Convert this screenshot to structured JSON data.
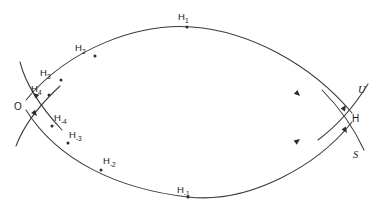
{
  "figure": {
    "name": "homoclinic-tangle-diagram",
    "background_color": "#ffffff",
    "stroke_color": "#3a3a3a",
    "label_color": "#1a1a1a",
    "width": 383,
    "height": 214
  },
  "fixed_points": {
    "origin": {
      "label": "O",
      "x": 22,
      "y": 105
    },
    "homoclinic": {
      "label": "H",
      "x": 353,
      "y": 118
    }
  },
  "manifolds": {
    "unstable": {
      "label": "U",
      "x": 362,
      "y": 90
    },
    "stable": {
      "label": "S",
      "x": 357,
      "y": 154
    }
  },
  "upper_orbit_points": [
    {
      "base": "H",
      "sub": "1",
      "label_x": 178,
      "label_y": 20,
      "dot_x": 187,
      "dot_y": 27
    },
    {
      "base": "H",
      "sub": "2",
      "label_x": 75,
      "label_y": 51,
      "dot_x": 95,
      "dot_y": 56
    },
    {
      "base": "H",
      "sub": "3",
      "label_x": 40,
      "label_y": 76,
      "dot_x": 61,
      "dot_y": 80
    },
    {
      "base": "H",
      "sub": "4",
      "label_x": 33,
      "label_y": 92,
      "dot_x": 48,
      "dot_y": 94
    }
  ],
  "lower_orbit_points": [
    {
      "base": "H",
      "sub": "-1",
      "label_x": 178,
      "label_y": 193,
      "dot_x": 188,
      "dot_y": 197
    },
    {
      "base": "H",
      "sub": "-2",
      "label_x": 104,
      "label_y": 164,
      "dot_x": 100,
      "dot_y": 170
    },
    {
      "base": "H",
      "sub": "-3",
      "label_x": 70,
      "label_y": 138,
      "dot_x": 67,
      "dot_y": 143
    },
    {
      "base": "H",
      "sub": "-4",
      "label_x": 55,
      "label_y": 121,
      "dot_x": 51,
      "dot_y": 126
    }
  ],
  "paths": {
    "upper_curve": "M 26,100 C 70,47 140,23 192,27 C 248,31 310,63 352,113",
    "lower_curve": "M 26,110 C 58,161 118,189 188,197 C 250,204 318,165 352,122",
    "origin_stable_branch": "M 20,62 C 24,78 34,100 62,130",
    "origin_unstable_branch": "M 16,146 C 22,130 34,110 60,86",
    "h_unstable_branch": "M 318,140 C 334,128 352,110 368,84",
    "h_stable_branch": "M 322,90 C 336,104 352,124 364,150"
  },
  "arrows": {
    "upper_toward_h": {
      "x": 300,
      "y": 96,
      "angle": 44
    },
    "lower_toward_h": {
      "x": 300,
      "y": 139,
      "angle": -37
    },
    "upper_toward_o": {
      "x": 45,
      "y": 97,
      "angle": 215
    },
    "lower_toward_o": {
      "x": 45,
      "y": 117,
      "angle": 52
    },
    "h_unstable_up": {
      "x": 345,
      "y": 106,
      "angle": -56
    },
    "h_stable_down": {
      "x": 345,
      "y": 132,
      "angle": 55
    },
    "o_upper_left": {
      "x": 33,
      "y": 93,
      "angle": 220
    },
    "o_lower_right": {
      "x": 35,
      "y": 114,
      "angle": 50
    }
  }
}
